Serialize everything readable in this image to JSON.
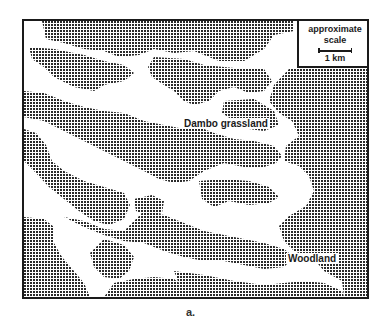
{
  "figure": {
    "caption": "a.",
    "legend": {
      "line1": "approximate",
      "line2": "scale",
      "scale_label": "1 km"
    },
    "labels": {
      "grassland": "Dambo grassland",
      "woodland": "Woodland"
    },
    "colors": {
      "ink": "#1a1a1a",
      "stipple": "#2a2a2a",
      "background": "#ffffff"
    },
    "map_legend_semantics": {
      "stippled_area": "Woodland",
      "white_area": "Dambo grassland"
    }
  }
}
